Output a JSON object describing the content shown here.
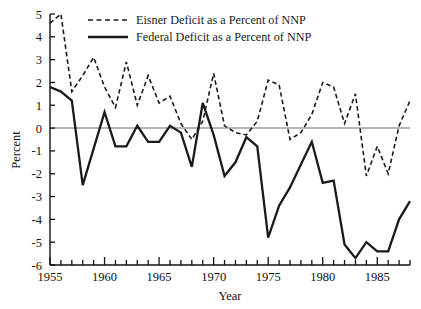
{
  "chart_data": {
    "type": "line",
    "title": "",
    "xlabel": "Year",
    "ylabel": "Percent",
    "xlim": [
      1955,
      1988
    ],
    "ylim": [
      -6,
      5
    ],
    "grid": false,
    "zero_line": true,
    "legend_position": "top-center",
    "x": [
      1955,
      1956,
      1957,
      1958,
      1959,
      1960,
      1961,
      1962,
      1963,
      1964,
      1965,
      1966,
      1967,
      1968,
      1969,
      1970,
      1971,
      1972,
      1973,
      1974,
      1975,
      1976,
      1977,
      1978,
      1979,
      1980,
      1981,
      1982,
      1983,
      1984,
      1985,
      1986,
      1987,
      1988
    ],
    "series": [
      {
        "name": "Eisner Deficit as a Percent of NNP",
        "style": "dashed",
        "color": "#1a1a1a",
        "values": [
          4.6,
          5.0,
          1.6,
          2.3,
          3.1,
          1.8,
          0.9,
          2.9,
          1.0,
          2.3,
          1.1,
          1.4,
          0.2,
          -0.5,
          0.3,
          2.4,
          0.1,
          -0.2,
          -0.3,
          0.3,
          2.1,
          1.9,
          -0.5,
          -0.2,
          0.6,
          2.0,
          1.8,
          0.2,
          1.5,
          -2.1,
          -0.8,
          -2.0,
          0.1,
          1.2
        ]
      },
      {
        "name": "Federal Deficit as a Percent of NNP",
        "style": "solid",
        "color": "#1a1a1a",
        "values": [
          1.8,
          1.6,
          1.2,
          -2.5,
          -0.9,
          0.7,
          -0.8,
          -0.8,
          0.1,
          -0.6,
          -0.6,
          0.1,
          -0.2,
          -1.7,
          1.1,
          -0.3,
          -2.1,
          -1.5,
          -0.4,
          -0.8,
          -4.8,
          -3.4,
          -2.6,
          -1.6,
          -0.6,
          -2.4,
          -2.3,
          -5.1,
          -5.7,
          -5.0,
          -5.4,
          -5.4,
          -4.0,
          -3.2
        ]
      }
    ],
    "y_ticks": [
      5,
      4,
      3,
      2,
      1,
      0,
      -1,
      -2,
      -3,
      -4,
      -5,
      -6
    ],
    "y_tick_labels": [
      "5",
      "4",
      "3",
      "2",
      "1",
      "0",
      "-1",
      "-2",
      "-3",
      "-4",
      "-5",
      "-6"
    ],
    "x_major_ticks": [
      1955,
      1960,
      1965,
      1970,
      1975,
      1980,
      1985
    ],
    "x_tick_labels": [
      "1955",
      "1960",
      "1965",
      "1970",
      "1975",
      "1980",
      "1985"
    ]
  },
  "legend": {
    "items": [
      {
        "label": "Eisner Deficit as a Percent of NNP",
        "style": "dashed"
      },
      {
        "label": "Federal Deficit as a Percent of NNP",
        "style": "solid"
      }
    ]
  },
  "axes": {
    "y_title": "Percent",
    "x_title": "Year"
  },
  "colors": {
    "line": "#1a1a1a",
    "axis": "#111111",
    "zero_line": "#6d6d6d",
    "background": "#ffffff"
  }
}
